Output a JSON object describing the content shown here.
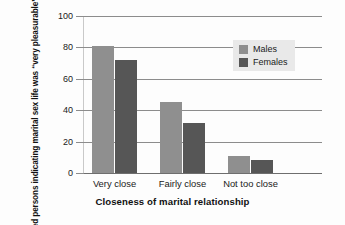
{
  "chart_data": {
    "type": "bar",
    "title": "",
    "xlabel": "Closeness of marital relationship",
    "ylabel": "Married persons indicating marital sex life was “very pleasurable” in past year (%)",
    "categories": [
      "Very close",
      "Fairly close",
      "Not too close"
    ],
    "series": [
      {
        "name": "Males",
        "values": [
          81,
          45,
          11
        ],
        "color": "#8f8f8f"
      },
      {
        "name": "Females",
        "values": [
          72,
          32,
          8
        ],
        "color": "#565656"
      }
    ],
    "ylim": [
      0,
      100
    ],
    "yticks": [
      0,
      20,
      40,
      60,
      80,
      100
    ],
    "ytick_labels": [
      "0",
      "20",
      "40",
      "60",
      "80",
      "100"
    ],
    "grid": true,
    "legend_position": "top-right"
  },
  "legend": {
    "entries": [
      {
        "label": "Males",
        "swatch": "males-swatch"
      },
      {
        "label": "Females",
        "swatch": "females-swatch"
      }
    ]
  },
  "colors": {
    "males": "#8f8f8f",
    "females": "#565656",
    "gridline": "#8c8c8c",
    "legend_background": "#e9e9e9",
    "text": "#1a1a1a",
    "background": "#fdfdfd"
  }
}
